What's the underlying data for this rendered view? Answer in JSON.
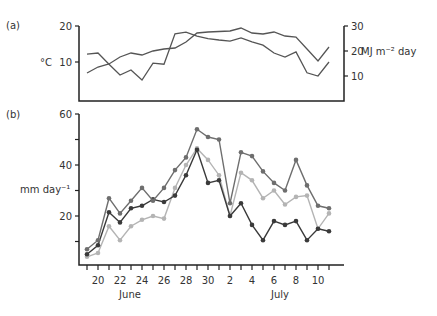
{
  "chart_data": [
    {
      "panel": "(a)",
      "type": "line",
      "x": [
        "19",
        "20",
        "21",
        "22",
        "23",
        "24",
        "25",
        "26",
        "27",
        "28",
        "29",
        "30",
        "1",
        "2",
        "3",
        "4",
        "5",
        "6",
        "7",
        "8",
        "9",
        "10",
        "11"
      ],
      "months": [
        {
          "label": "June",
          "start": 0,
          "end": 11
        },
        {
          "label": "July",
          "start": 12,
          "end": 22
        }
      ],
      "left_axis": {
        "label": "°C",
        "ticks": [
          10,
          20
        ],
        "range": [
          0.5,
          20
        ]
      },
      "right_axis": {
        "label": "MJ m⁻² day",
        "ticks": [
          10,
          20,
          30
        ],
        "range": [
          0,
          30
        ]
      },
      "series": [
        {
          "name": "temperature",
          "axis": "left",
          "color": "#555555",
          "values": [
            12.2,
            12.5,
            9.4,
            6.4,
            7.8,
            5.0,
            9.7,
            9.4,
            17.8,
            18.3,
            17.2,
            16.5,
            16.1,
            15.8,
            16.7,
            15.6,
            14.7,
            12.5,
            11.4,
            12.8,
            7.0,
            6.1,
            10.0
          ]
        },
        {
          "name": "radiation",
          "axis": "right",
          "color": "#555555",
          "values": [
            11.2,
            13.6,
            14.8,
            17.6,
            19.2,
            18.4,
            20.0,
            20.8,
            21.2,
            23.6,
            27.2,
            27.6,
            27.8,
            28.0,
            29.2,
            27.2,
            26.8,
            27.6,
            26.0,
            25.6,
            20.8,
            16.0,
            21.6
          ]
        }
      ]
    },
    {
      "panel": "(b)",
      "type": "line",
      "x": [
        "19",
        "20",
        "21",
        "22",
        "23",
        "24",
        "25",
        "26",
        "27",
        "28",
        "29",
        "30",
        "1",
        "2",
        "3",
        "4",
        "5",
        "6",
        "7",
        "8",
        "9",
        "10",
        "11"
      ],
      "xtick_labels": [
        "20",
        "22",
        "24",
        "26",
        "28",
        "30",
        "2",
        "4",
        "6",
        "8",
        "10"
      ],
      "months": [
        {
          "label": "June"
        },
        {
          "label": "July"
        }
      ],
      "ylabel": "mm day⁻¹",
      "yticks": [
        20,
        40,
        60
      ],
      "ylim": [
        0,
        60
      ],
      "series": [
        {
          "name": "series-medium",
          "color": "#6e6e6e",
          "values": [
            7,
            10.5,
            27,
            21,
            26,
            31,
            26,
            31,
            38,
            43,
            54,
            51,
            50,
            25,
            45,
            43.5,
            37.5,
            33,
            30,
            42,
            32,
            24,
            23
          ]
        },
        {
          "name": "series-dark",
          "color": "#3a3a3a",
          "values": [
            5,
            8.5,
            21.5,
            17.5,
            23,
            24,
            26.5,
            25.5,
            28,
            36,
            46,
            33,
            34,
            20,
            25,
            16.5,
            10.5,
            18,
            16.5,
            18,
            10.5,
            15,
            14
          ]
        },
        {
          "name": "series-light",
          "color": "#b4b4b4",
          "values": [
            4,
            5.5,
            16,
            10.5,
            16,
            18.5,
            20,
            19,
            31,
            40,
            46.5,
            42,
            36,
            20,
            37,
            34,
            27,
            30,
            24.5,
            27.5,
            28,
            15,
            21
          ]
        }
      ]
    }
  ],
  "labels": {
    "panel_a": "(a)",
    "panel_b": "(b)",
    "a_left_unit": "°C",
    "a_right_unit": "MJ m⁻² day",
    "b_unit": "mm day⁻¹",
    "june": "June",
    "july": "July"
  }
}
